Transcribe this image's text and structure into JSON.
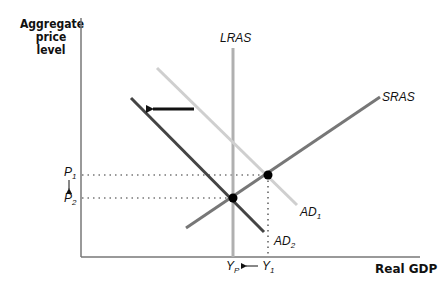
{
  "axes": {
    "y_label_lines": [
      "Aggregate",
      "price",
      "level"
    ],
    "x_label": "Real GDP"
  },
  "curves": {
    "lras": {
      "label": "LRAS",
      "color": "#b0b0b0"
    },
    "sras": {
      "label": "SRAS",
      "color": "#777777"
    },
    "ad1": {
      "label": "AD",
      "sub": "1",
      "color": "#cfcfcf"
    },
    "ad2": {
      "label": "AD",
      "sub": "2",
      "color": "#444444"
    }
  },
  "price_levels": {
    "p1": {
      "label": "P",
      "sub": "1"
    },
    "p2": {
      "label": "P",
      "sub": "2"
    }
  },
  "output_levels": {
    "yp": {
      "label": "Y",
      "sub": "P"
    },
    "y1": {
      "label": "Y",
      "sub": "1"
    }
  },
  "annotations": {
    "shift_arrow": "leftward shift of AD from AD1 to AD2",
    "price_arrow": "P1 falls to P2",
    "output_arrow": "Y1 falls to YP"
  }
}
